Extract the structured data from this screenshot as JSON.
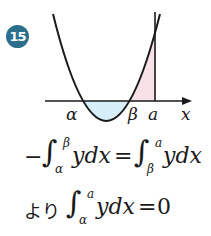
{
  "problem": {
    "number": "15",
    "badge_color": "#2c6f8c"
  },
  "graph": {
    "curve": "parabola",
    "axis_label": "x",
    "roots": [
      "α",
      "β"
    ],
    "vertical_line_label": "a",
    "shaded_regions": [
      {
        "from": "α",
        "to": "β",
        "side": "below axis",
        "color": "#d6eef7"
      },
      {
        "from": "β",
        "to": "a",
        "side": "above axis",
        "color": "#f9e1e8"
      }
    ],
    "labels": {
      "alpha": "α",
      "beta": "β",
      "a": "a",
      "x": "x"
    }
  },
  "equations": {
    "line1": {
      "minus": "−",
      "int1_lower": "α",
      "int1_upper": "β",
      "int1_body": "ydx",
      "equals": "=",
      "int2_lower": "β",
      "int2_upper": "a",
      "int2_body": "ydx"
    },
    "line2": {
      "prefix": "より",
      "int_lower": "α",
      "int_upper": "a",
      "int_body": "ydx",
      "equals": "=",
      "rhs": "0"
    }
  }
}
